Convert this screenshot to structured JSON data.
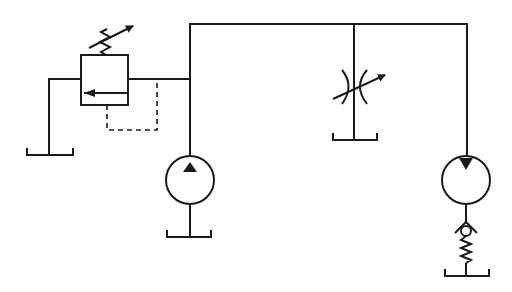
{
  "diagram": {
    "stroke_color": "#1a1a1a",
    "background": "#ffffff",
    "components": [
      {
        "id": "relief-valve",
        "label": "Adjustable pressure relief valve"
      },
      {
        "id": "pump",
        "label": "Fixed displacement hydraulic pump"
      },
      {
        "id": "throttle",
        "label": "Variable throttle valve"
      },
      {
        "id": "motor",
        "label": "Fixed displacement hydraulic motor"
      },
      {
        "id": "check-valve",
        "label": "Spring-loaded check valve (back pressure)"
      },
      {
        "id": "tank-relief",
        "label": "Tank"
      },
      {
        "id": "tank-pump",
        "label": "Tank"
      },
      {
        "id": "tank-throttle",
        "label": "Tank"
      },
      {
        "id": "tank-motor",
        "label": "Tank"
      }
    ]
  }
}
